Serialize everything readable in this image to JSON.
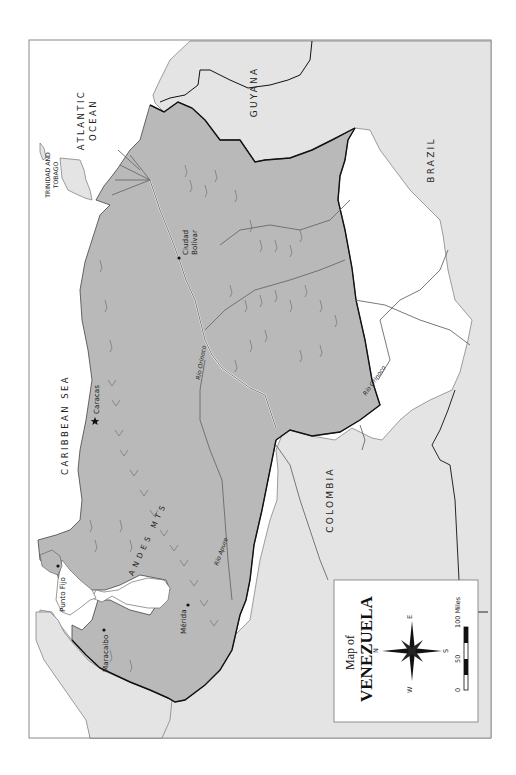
{
  "map": {
    "title_line1": "Map of",
    "title_line2": "VENEZUELA",
    "orientation": "rotated 90° counter-clockwise (north points left)",
    "colors": {
      "venezuela_fill": "#b9b9b9",
      "neighbor_fill": "#e4e4e4",
      "water_fill": "#ffffff",
      "border_stroke": "#111111",
      "river_stroke": "#6a6a6a",
      "frame_stroke": "#8a8a8a"
    },
    "water_bodies": {
      "atlantic_line1": "ATLANTIC",
      "atlantic_line2": "OCEAN",
      "caribbean": "CARIBBEAN SEA"
    },
    "countries": {
      "guyana": "GUYANA",
      "brazil": "BRAZIL",
      "colombia": "COLOMBIA",
      "trinidad_line1": "TRINIDAD AND",
      "trinidad_line2": "TOBAGO"
    },
    "cities": [
      {
        "name": "Caracas",
        "marker": "star",
        "capital": true
      },
      {
        "name": "Ciudad",
        "name2": "Bolívar",
        "marker": "dot"
      },
      {
        "name": "Punto Fijo",
        "marker": "dot"
      },
      {
        "name": "Maracaibo",
        "marker": "dot"
      },
      {
        "name": "Mérida",
        "marker": "dot"
      }
    ],
    "rivers": {
      "orinoco_lower": "Río Orinoco",
      "orinoco_upper": "Río Orinoco",
      "apure": "Río Apure"
    },
    "mountains": {
      "andes": "ANDES MTS"
    },
    "compass": {
      "n": "N",
      "s": "S",
      "e": "E",
      "w": "W"
    },
    "scale_bar": {
      "labels": [
        "0",
        "50",
        "100 Miles"
      ]
    }
  }
}
